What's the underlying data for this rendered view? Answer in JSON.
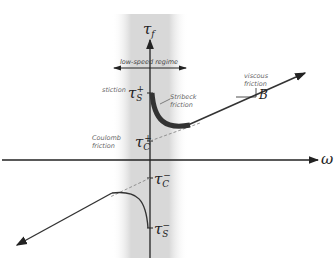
{
  "diagram": {
    "axes": {
      "y_label": "τ",
      "y_label_sub": "f",
      "x_label": "ω"
    },
    "regime": {
      "label": "low-speed regime"
    },
    "annotations": {
      "stiction": "stiction",
      "stribeck_line1": "Stribeck",
      "stribeck_line2": "friction",
      "viscous_line1": "viscous",
      "viscous_line2": "friction",
      "coulomb_line1": "Coulomb",
      "coulomb_line2": "friction",
      "slope": "B"
    },
    "levels": {
      "tau_s_plus": {
        "sym": "τ",
        "sub": "S",
        "sup": "+"
      },
      "tau_c_plus": {
        "sym": "τ",
        "sub": "C",
        "sup": "+"
      },
      "tau_c_minus": {
        "sym": "τ",
        "sub": "C",
        "sup": "−"
      },
      "tau_s_minus": {
        "sym": "τ",
        "sub": "S",
        "sup": "−"
      }
    },
    "colors": {
      "band": "#d9d9d9",
      "curve": "#333333",
      "stribeck_highlight": "#3a3a3a",
      "dashed": "#888888"
    }
  }
}
